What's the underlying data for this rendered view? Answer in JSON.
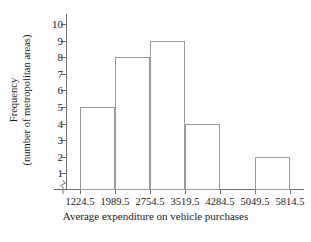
{
  "chart_data": {
    "type": "bar",
    "title": "",
    "subtitle": "",
    "xlabel": "Average expenditure on vehicle purchases",
    "ylabel_line1": "Frequency",
    "ylabel_line2": "(number of metropolitan areas)",
    "bin_edges": [
      "1224.5",
      "1989.5",
      "2754.5",
      "3519.5",
      "4284.5",
      "5049.5",
      "5814.5"
    ],
    "categories": [
      "1224.5-1989.5",
      "1989.5-2754.5",
      "2754.5-3519.5",
      "3519.5-4284.5",
      "4284.5-5049.5",
      "5049.5-5814.5"
    ],
    "values": [
      5,
      8,
      9,
      4,
      0,
      2
    ],
    "xtick_labels": [
      "1224.5",
      "1989.5",
      "2754.5",
      "3519.5",
      "4284.5",
      "5049.5",
      "5814.5"
    ],
    "ytick_labels": [
      "1",
      "2",
      "3",
      "4",
      "5",
      "6",
      "7",
      "8",
      "9",
      "10"
    ],
    "ytick_values": [
      1,
      2,
      3,
      4,
      5,
      6,
      7,
      8,
      9,
      10
    ],
    "ylim": [
      0,
      10.6
    ],
    "grid": false,
    "legend": false,
    "legend_position": "none",
    "axis_break": true,
    "bar_fill_color": "#ffffff",
    "bar_edge_color": "#9a9a9a",
    "axis_color": "#6e6e6e",
    "text_color": "#1a1a1a",
    "background_color": "#ffffff"
  }
}
